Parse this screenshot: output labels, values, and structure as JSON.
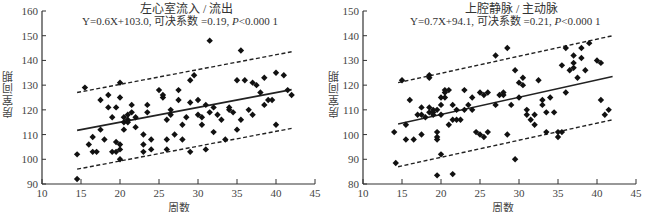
{
  "chart_data": [
    {
      "type": "scatter",
      "title": "左心室流入 / 流出",
      "equation": "Y=0.6X+103.0, 可决系数 =0.19, ",
      "p_label": "P",
      "p_value": "<0.000 1",
      "xlabel": "周数",
      "ylabel": "房室间期",
      "xlim": [
        10,
        45
      ],
      "ylim": [
        90,
        160
      ],
      "xticks": [
        10,
        15,
        20,
        25,
        30,
        35,
        40,
        45
      ],
      "yticks": [
        90,
        100,
        110,
        120,
        130,
        140,
        150,
        160
      ],
      "grid": false,
      "regression": {
        "slope": 0.6,
        "intercept": 103.0,
        "r2": 0.19,
        "x_range": [
          14.5,
          42
        ]
      },
      "prediction_bands": {
        "upper": [
          [
            14.5,
            127
          ],
          [
            42,
            143.5
          ]
        ],
        "lower": [
          [
            14.5,
            96
          ],
          [
            42,
            112.5
          ]
        ]
      },
      "points": [
        [
          14.5,
          92
        ],
        [
          14.5,
          102
        ],
        [
          15.5,
          129
        ],
        [
          16,
          106
        ],
        [
          16.5,
          109
        ],
        [
          16.5,
          103
        ],
        [
          17,
          103
        ],
        [
          17.5,
          124
        ],
        [
          17.5,
          112
        ],
        [
          18,
          108
        ],
        [
          18.5,
          121
        ],
        [
          18.5,
          126
        ],
        [
          19,
          117
        ],
        [
          19,
          103
        ],
        [
          19.5,
          103
        ],
        [
          19.5,
          107
        ],
        [
          19.5,
          121
        ],
        [
          20,
          125
        ],
        [
          20,
          131
        ],
        [
          20,
          100
        ],
        [
          20,
          106
        ],
        [
          20,
          104
        ],
        [
          20.5,
          117
        ],
        [
          20.5,
          115
        ],
        [
          20.5,
          112
        ],
        [
          21,
          116
        ],
        [
          21,
          118
        ],
        [
          21,
          115
        ],
        [
          21.5,
          122
        ],
        [
          21.5,
          119
        ],
        [
          22,
          113
        ],
        [
          22,
          117
        ],
        [
          23,
          110
        ],
        [
          23,
          106
        ],
        [
          23,
          103
        ],
        [
          23.5,
          122
        ],
        [
          23.5,
          119
        ],
        [
          24,
          108
        ],
        [
          24,
          104
        ],
        [
          25,
          128
        ],
        [
          25.5,
          125
        ],
        [
          25.5,
          126
        ],
        [
          26,
          116
        ],
        [
          26,
          108
        ],
        [
          26,
          104
        ],
        [
          26.5,
          120
        ],
        [
          26.5,
          118
        ],
        [
          27,
          110
        ],
        [
          27.5,
          128
        ],
        [
          27.5,
          124
        ],
        [
          28,
          114
        ],
        [
          28,
          108
        ],
        [
          28.5,
          117
        ],
        [
          29,
          132
        ],
        [
          29,
          123
        ],
        [
          29,
          103
        ],
        [
          29.5,
          134
        ],
        [
          30,
          124
        ],
        [
          30,
          118
        ],
        [
          30.5,
          117
        ],
        [
          30.5,
          114
        ],
        [
          31,
          122
        ],
        [
          31,
          104
        ],
        [
          31.5,
          119
        ],
        [
          31.5,
          148
        ],
        [
          32,
          121
        ],
        [
          32,
          111
        ],
        [
          32.5,
          118
        ],
        [
          33,
          116
        ],
        [
          33.5,
          108
        ],
        [
          34,
          120
        ],
        [
          34,
          121
        ],
        [
          34.5,
          119
        ],
        [
          35,
          132
        ],
        [
          35,
          112
        ],
        [
          35.5,
          144
        ],
        [
          35.5,
          116
        ],
        [
          36,
          132
        ],
        [
          36.5,
          120
        ],
        [
          37,
          131
        ],
        [
          37,
          118
        ],
        [
          37.5,
          130
        ],
        [
          38,
          127
        ],
        [
          38.5,
          133
        ],
        [
          38.5,
          122
        ],
        [
          39,
          124
        ],
        [
          39.5,
          124
        ],
        [
          40,
          114
        ],
        [
          40,
          135
        ],
        [
          41,
          134
        ],
        [
          41.5,
          128
        ],
        [
          42,
          126
        ]
      ]
    },
    {
      "type": "scatter",
      "title": "上腔静脉 / 主动脉",
      "equation": "Y=0.7X+94.1, 可决系数 =0.21, ",
      "p_label": "P",
      "p_value": "<0.000 1",
      "xlabel": "周数",
      "ylabel": "房室间期",
      "xlim": [
        10,
        45
      ],
      "ylim": [
        80,
        150
      ],
      "xticks": [
        10,
        15,
        20,
        25,
        30,
        35,
        40,
        45
      ],
      "yticks": [
        80,
        90,
        100,
        110,
        120,
        130,
        140,
        150
      ],
      "grid": false,
      "regression": {
        "slope": 0.7,
        "intercept": 94.1,
        "r2": 0.21,
        "x_range": [
          14.5,
          42
        ]
      },
      "prediction_bands": {
        "upper": [
          [
            14.5,
            121
          ],
          [
            42,
            140
          ]
        ],
        "lower": [
          [
            14.5,
            87
          ],
          [
            42,
            106
          ]
        ]
      },
      "points": [
        [
          14,
          101
        ],
        [
          14.2,
          88.5
        ],
        [
          15,
          122
        ],
        [
          15.5,
          104
        ],
        [
          15.5,
          98
        ],
        [
          16,
          114
        ],
        [
          16.5,
          98
        ],
        [
          17,
          108
        ],
        [
          17.5,
          111
        ],
        [
          17.5,
          108
        ],
        [
          17.5,
          100
        ],
        [
          18,
          107
        ],
        [
          18.5,
          124
        ],
        [
          18.5,
          123
        ],
        [
          18.5,
          109
        ],
        [
          18.5,
          111
        ],
        [
          19,
          110
        ],
        [
          19,
          109
        ],
        [
          19,
          108
        ],
        [
          19.5,
          101
        ],
        [
          19.5,
          99
        ],
        [
          19.5,
          83.5
        ],
        [
          19.5,
          98
        ],
        [
          19.5,
          110
        ],
        [
          20,
          92
        ],
        [
          20,
          115
        ],
        [
          20,
          112
        ],
        [
          20,
          108
        ],
        [
          20.5,
          118
        ],
        [
          20.5,
          117
        ],
        [
          20.5,
          115
        ],
        [
          21,
          118
        ],
        [
          21,
          104
        ],
        [
          21.5,
          84
        ],
        [
          21.5,
          106
        ],
        [
          21.5,
          112
        ],
        [
          22,
          110
        ],
        [
          22,
          106
        ],
        [
          22.5,
          106
        ],
        [
          23,
          118
        ],
        [
          23,
          110
        ],
        [
          23.5,
          112
        ],
        [
          24,
          115
        ],
        [
          24,
          110
        ],
        [
          24.5,
          101
        ],
        [
          25,
          117
        ],
        [
          25,
          100
        ],
        [
          25.5,
          99
        ],
        [
          25.5,
          116
        ],
        [
          26,
          117
        ],
        [
          26,
          101
        ],
        [
          27,
          112
        ],
        [
          27,
          132
        ],
        [
          27.5,
          116
        ],
        [
          28,
          117
        ],
        [
          28,
          116
        ],
        [
          28.5,
          100
        ],
        [
          28.5,
          135
        ],
        [
          29,
          112
        ],
        [
          29.5,
          126
        ],
        [
          29.5,
          90
        ],
        [
          30,
          121
        ],
        [
          30,
          115
        ],
        [
          30.5,
          123
        ],
        [
          30.5,
          120
        ],
        [
          31,
          108
        ],
        [
          31,
          110
        ],
        [
          31.5,
          106
        ],
        [
          32,
          108
        ],
        [
          32,
          104
        ],
        [
          32.5,
          122
        ],
        [
          33,
          112
        ],
        [
          33,
          114
        ],
        [
          33.5,
          101
        ],
        [
          33.5,
          109
        ],
        [
          34,
          115
        ],
        [
          34.5,
          109
        ],
        [
          35,
          101
        ],
        [
          35,
          99
        ],
        [
          35.5,
          101
        ],
        [
          35.5,
          128
        ],
        [
          36,
          135
        ],
        [
          36,
          117
        ],
        [
          36.5,
          126
        ],
        [
          37,
          132
        ],
        [
          37,
          129
        ],
        [
          37,
          127
        ],
        [
          37.5,
          123
        ],
        [
          38,
          131
        ],
        [
          38,
          135
        ],
        [
          38.5,
          126
        ],
        [
          39,
          137
        ],
        [
          40,
          130
        ],
        [
          40.5,
          129
        ],
        [
          40.5,
          114
        ],
        [
          41,
          108
        ],
        [
          41.5,
          110
        ]
      ]
    }
  ],
  "panels": {
    "left": {
      "title": "左心室流入 / 流出",
      "equation_prefix": "Y=0.6X+103.0, 可决系数 =0.19, ",
      "p_label": "P",
      "p_value": "<0.000 1",
      "xlabel": "周数",
      "ylabel": "房室间期"
    },
    "right": {
      "title": "上腔静脉 / 主动脉",
      "equation_prefix": "Y=0.7X+94.1, 可决系数 =0.21, ",
      "p_label": "P",
      "p_value": "<0.000 1",
      "xlabel": "周数",
      "ylabel": "房室间期"
    }
  },
  "colors": {
    "marker": "#111111",
    "axis": "#333333",
    "line": "#222222"
  }
}
